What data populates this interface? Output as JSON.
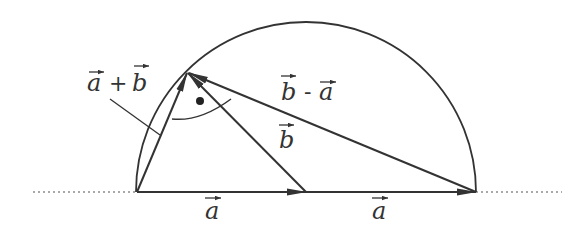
{
  "diagram": {
    "title": "",
    "colors": {
      "stroke": "#333333",
      "background": "#ffffff"
    },
    "points": {
      "origin": [
        137,
        192
      ],
      "mid": [
        306,
        192
      ],
      "right": [
        476,
        192
      ],
      "top": [
        187,
        73
      ]
    },
    "semicircle": {
      "center": [
        306,
        192
      ],
      "radius": 170
    },
    "labels": {
      "a_plus_b": {
        "a": "a",
        "plus": "+",
        "b": "b"
      },
      "b_minus_a": {
        "b": "b",
        "minus": "-",
        "a": "a"
      },
      "b": "b",
      "a_left": "a",
      "a_right": "a"
    },
    "annotations": {
      "right_angle_marker": "dot",
      "description": "Thales semicircle: vectors a+b and b-a are perpendicular when |a| = |b|"
    }
  }
}
